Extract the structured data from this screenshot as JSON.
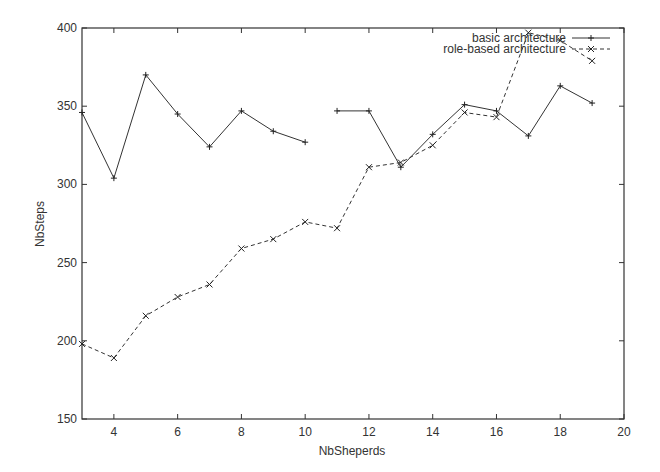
{
  "chart_data": {
    "type": "line",
    "title": "",
    "xlabel": "NbSheperds",
    "ylabel": "NbSteps",
    "xlim": [
      3,
      20
    ],
    "ylim": [
      150,
      400
    ],
    "x_ticks": [
      4,
      6,
      8,
      10,
      12,
      14,
      16,
      18,
      20
    ],
    "y_ticks": [
      150,
      200,
      250,
      300,
      350,
      400
    ],
    "grid": false,
    "legend_position": "top-right",
    "x": [
      3,
      4,
      5,
      6,
      7,
      8,
      9,
      10,
      11,
      12,
      13,
      14,
      15,
      16,
      17,
      18,
      19
    ],
    "series": [
      {
        "name": "basic architecture",
        "style": "solid",
        "marker": "+",
        "segments": [
          [
            3,
            10
          ],
          [
            11,
            19
          ]
        ],
        "values": [
          346,
          304,
          370,
          345,
          324,
          347,
          334,
          327,
          347,
          347,
          311,
          332,
          351,
          347,
          331,
          363,
          352
        ]
      },
      {
        "name": "role-based architecture",
        "style": "dashed",
        "marker": "x",
        "values": [
          198,
          189,
          216,
          228,
          236,
          259,
          265,
          276,
          272,
          311,
          314,
          325,
          346,
          343,
          397,
          392,
          379
        ]
      }
    ]
  },
  "axes": {
    "xlabel": "NbSheperds",
    "ylabel": "NbSteps"
  },
  "legend": {
    "items": [
      {
        "label": "basic architecture"
      },
      {
        "label": "role-based architecture"
      }
    ]
  }
}
